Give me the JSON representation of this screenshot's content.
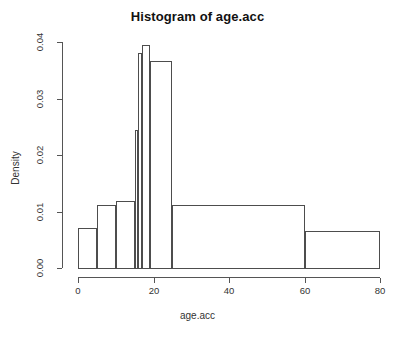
{
  "chart_data": {
    "type": "bar",
    "subtype": "histogram",
    "title": "Histogram of age.acc",
    "xlabel": "age.acc",
    "ylabel": "Density",
    "xlim": [
      0,
      80
    ],
    "ylim": [
      0,
      0.04
    ],
    "xticks": [
      0,
      20,
      40,
      60,
      80
    ],
    "xtick_labels": [
      "0",
      "20",
      "40",
      "60",
      "80"
    ],
    "yticks": [
      0.0,
      0.01,
      0.02,
      0.03,
      0.04
    ],
    "ytick_labels": [
      "0.00",
      "0.01",
      "0.02",
      "0.03",
      "0.04"
    ],
    "grid": false,
    "legend": false,
    "bar_fill": "none",
    "bar_edge_color": "#4d4d4d",
    "bins": [
      {
        "left": 0,
        "right": 5,
        "density": 0.007,
        "label": "0-5"
      },
      {
        "left": 5,
        "right": 10,
        "density": 0.0112,
        "label": "5-10"
      },
      {
        "left": 10,
        "right": 15,
        "density": 0.0118,
        "label": "10-15"
      },
      {
        "left": 15,
        "right": 16,
        "density": 0.0245,
        "label": "15-16"
      },
      {
        "left": 16,
        "right": 17,
        "density": 0.038,
        "label": "16-17"
      },
      {
        "left": 17,
        "right": 19,
        "density": 0.0395,
        "label": "17-19"
      },
      {
        "left": 19,
        "right": 25,
        "density": 0.0367,
        "label": "19-25"
      },
      {
        "left": 25,
        "right": 60,
        "density": 0.0112,
        "label": "25-60"
      },
      {
        "left": 60,
        "right": 80,
        "density": 0.0065,
        "label": "60-80"
      }
    ]
  },
  "plot": {
    "background_color": "#ffffff",
    "axis_color": "#555555",
    "text_color": "#333333",
    "title_color": "#111111"
  }
}
